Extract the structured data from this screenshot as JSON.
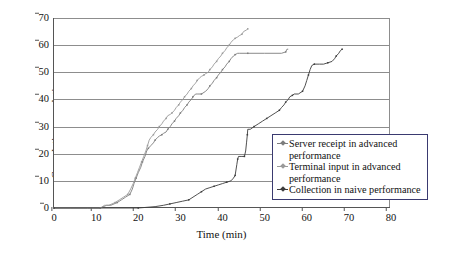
{
  "chart_data": {
    "type": "line",
    "title": "",
    "xlabel": "Time (min)",
    "ylabel": "Cumulative population",
    "xlim": [
      0,
      80
    ],
    "ylim": [
      0,
      70
    ],
    "xticks": [
      "0",
      "10",
      "20",
      "30",
      "40",
      "50",
      "60",
      "70",
      "80"
    ],
    "yticks": [
      "0",
      "10",
      "20",
      "30",
      "40",
      "50",
      "60",
      "70"
    ],
    "grid": "horizontal",
    "legend_position": "lower-right",
    "series": [
      {
        "name": "Server receipt in advanced performance",
        "label_line1": "Server receipt in advanced",
        "label_line2": "performance",
        "color": "#7d7d7d",
        "points": [
          [
            0,
            0
          ],
          [
            4,
            0
          ],
          [
            8,
            0
          ],
          [
            11,
            0
          ],
          [
            12.5,
            1
          ],
          [
            13.5,
            1
          ],
          [
            15,
            2
          ],
          [
            16,
            3
          ],
          [
            17,
            4
          ],
          [
            18,
            5
          ],
          [
            18.6,
            7
          ],
          [
            19,
            9
          ],
          [
            19.5,
            11
          ],
          [
            20,
            13
          ],
          [
            20.6,
            15
          ],
          [
            21,
            17
          ],
          [
            21.6,
            19
          ],
          [
            22,
            21
          ],
          [
            22.4,
            22
          ],
          [
            23,
            23
          ],
          [
            23.6,
            24
          ],
          [
            24,
            25
          ],
          [
            24.6,
            26
          ],
          [
            25,
            26.5
          ],
          [
            25.6,
            27
          ],
          [
            26,
            27.5
          ],
          [
            26.6,
            28
          ],
          [
            27,
            29
          ],
          [
            27.6,
            30
          ],
          [
            28,
            31
          ],
          [
            28.6,
            32
          ],
          [
            29,
            33
          ],
          [
            29.6,
            34
          ],
          [
            30,
            35
          ],
          [
            30.6,
            36
          ],
          [
            31,
            37
          ],
          [
            31.6,
            38
          ],
          [
            32,
            39
          ],
          [
            32.6,
            40
          ],
          [
            33,
            41
          ],
          [
            33.6,
            42
          ],
          [
            34,
            42
          ],
          [
            35,
            42
          ],
          [
            36,
            43
          ],
          [
            36.6,
            44
          ],
          [
            37,
            45
          ],
          [
            37.6,
            46
          ],
          [
            38,
            47
          ],
          [
            38.6,
            48
          ],
          [
            39,
            49
          ],
          [
            39.6,
            50
          ],
          [
            40,
            51
          ],
          [
            40.6,
            52
          ],
          [
            41,
            53
          ],
          [
            41.6,
            54
          ],
          [
            42,
            55
          ],
          [
            42.6,
            56
          ],
          [
            43,
            56.5
          ],
          [
            43.6,
            57
          ],
          [
            44,
            57
          ],
          [
            46,
            57
          ],
          [
            50,
            57
          ],
          [
            54,
            57
          ],
          [
            55,
            57.5
          ],
          [
            55.3,
            58.5
          ],
          [
            55.6,
            58.5
          ]
        ]
      },
      {
        "name": "Terminal input in advanced performance",
        "label_line1": "Terminal input in advanced",
        "label_line2": "performance",
        "color": "#9a9a9a",
        "points": [
          [
            0,
            0
          ],
          [
            5,
            0
          ],
          [
            9,
            0
          ],
          [
            11,
            0
          ],
          [
            12,
            1
          ],
          [
            13,
            1
          ],
          [
            14.5,
            2
          ],
          [
            15.5,
            3
          ],
          [
            16.5,
            4
          ],
          [
            17.5,
            5
          ],
          [
            18.2,
            7
          ],
          [
            18.8,
            9
          ],
          [
            19.3,
            11
          ],
          [
            19.8,
            13
          ],
          [
            20.3,
            15
          ],
          [
            20.8,
            17
          ],
          [
            21.3,
            19
          ],
          [
            21.8,
            21
          ],
          [
            22.2,
            23
          ],
          [
            22.6,
            25
          ],
          [
            23,
            26
          ],
          [
            23.6,
            27
          ],
          [
            24,
            28
          ],
          [
            24.6,
            29
          ],
          [
            25,
            30
          ],
          [
            25.6,
            31
          ],
          [
            26,
            32
          ],
          [
            26.6,
            33
          ],
          [
            27,
            34
          ],
          [
            27.6,
            34.5
          ],
          [
            28,
            35
          ],
          [
            28.6,
            36
          ],
          [
            29,
            37
          ],
          [
            29.6,
            38
          ],
          [
            30,
            39
          ],
          [
            30.6,
            40
          ],
          [
            31,
            41
          ],
          [
            31.6,
            42
          ],
          [
            32,
            43
          ],
          [
            32.6,
            44
          ],
          [
            33,
            45
          ],
          [
            33.6,
            46
          ],
          [
            34,
            47
          ],
          [
            34.6,
            48
          ],
          [
            35,
            48.5
          ],
          [
            35.6,
            49
          ],
          [
            36,
            49.5
          ],
          [
            36.6,
            50
          ],
          [
            37,
            51
          ],
          [
            37.6,
            52
          ],
          [
            38,
            53
          ],
          [
            38.6,
            54
          ],
          [
            39,
            55
          ],
          [
            39.6,
            56
          ],
          [
            40,
            57
          ],
          [
            40.6,
            58
          ],
          [
            41,
            59
          ],
          [
            41.6,
            60
          ],
          [
            42,
            61
          ],
          [
            42.6,
            62
          ],
          [
            43,
            62.5
          ],
          [
            43.6,
            63
          ],
          [
            44,
            63.5
          ],
          [
            44.6,
            64
          ],
          [
            45,
            65
          ],
          [
            45.6,
            65.5
          ],
          [
            46,
            66
          ]
        ]
      },
      {
        "name": "Collection in naive performance",
        "label_line1": "Collection in naive performance",
        "label_line2": "",
        "color": "#3c3c3c",
        "points": [
          [
            0,
            0
          ],
          [
            8,
            0
          ],
          [
            14,
            0
          ],
          [
            20,
            0
          ],
          [
            24,
            0.5
          ],
          [
            26,
            1
          ],
          [
            27.5,
            1.5
          ],
          [
            29,
            2
          ],
          [
            30.5,
            2.5
          ],
          [
            32,
            3
          ],
          [
            33,
            4
          ],
          [
            34,
            5
          ],
          [
            35,
            6
          ],
          [
            36,
            7
          ],
          [
            37,
            7.5
          ],
          [
            38,
            8
          ],
          [
            39,
            8.5
          ],
          [
            40,
            9
          ],
          [
            41,
            9.5
          ],
          [
            42,
            10
          ],
          [
            42.6,
            11
          ],
          [
            43,
            12
          ],
          [
            43.2,
            14
          ],
          [
            43.4,
            16
          ],
          [
            43.6,
            18
          ],
          [
            43.8,
            19
          ],
          [
            44.6,
            19
          ],
          [
            45.2,
            19
          ],
          [
            45.5,
            21
          ],
          [
            45.7,
            24
          ],
          [
            45.9,
            27
          ],
          [
            46,
            29
          ],
          [
            46.6,
            29
          ],
          [
            47.5,
            30
          ],
          [
            48.5,
            31
          ],
          [
            49.5,
            32
          ],
          [
            50.5,
            33
          ],
          [
            51.5,
            34
          ],
          [
            52.5,
            35
          ],
          [
            53.5,
            36
          ],
          [
            54,
            37
          ],
          [
            54.6,
            38
          ],
          [
            55,
            39
          ],
          [
            55.6,
            40
          ],
          [
            56,
            41
          ],
          [
            56.6,
            41.5
          ],
          [
            57,
            42
          ],
          [
            58,
            42
          ],
          [
            59,
            43
          ],
          [
            59.6,
            45
          ],
          [
            60,
            47
          ],
          [
            60.4,
            49
          ],
          [
            60.8,
            51
          ],
          [
            61.2,
            52.5
          ],
          [
            61.8,
            53
          ],
          [
            63,
            53
          ],
          [
            64,
            53
          ],
          [
            65,
            53.5
          ],
          [
            66,
            54
          ],
          [
            66.6,
            55
          ],
          [
            67,
            56
          ],
          [
            67.6,
            57
          ],
          [
            68,
            58
          ],
          [
            68.4,
            58.5
          ]
        ]
      }
    ]
  },
  "legend": {
    "entries": [
      {
        "text": "Server receipt in advanced\nperformance",
        "color": "#7d7d7d"
      },
      {
        "text": "Terminal input in advanced\nperformance",
        "color": "#9a9a9a"
      },
      {
        "text": "Collection in naive performance",
        "color": "#3c3c3c"
      }
    ]
  }
}
